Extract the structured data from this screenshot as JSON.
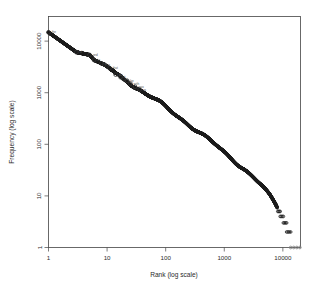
{
  "figure": {
    "title": "",
    "background": "#ffffff",
    "plot_background": "#ffffff",
    "frame_color": "#444444"
  },
  "chart_data": {
    "type": "scatter",
    "title": "",
    "subtitle": "",
    "xlabel": "Rank (log scale)",
    "ylabel": "Frequency (log scale)",
    "xscale": "log",
    "yscale": "log",
    "grid": false,
    "legend": null,
    "xlim": [
      1,
      20000
    ],
    "ylim": [
      1,
      30000
    ],
    "xticks": [
      1,
      10,
      100,
      1000,
      10000
    ],
    "xticklabels": [
      "1",
      "10",
      "100",
      "1000",
      "10000"
    ],
    "yticks": [
      1,
      10,
      100,
      1000,
      10000
    ],
    "yticklabels": [
      "1",
      "10",
      "100",
      "1000",
      "10000"
    ],
    "marker": "open-circle",
    "marker_color": "#1a1a1a",
    "tail_color": "#7a7a7a",
    "points": [
      {
        "rank": 1,
        "freq": 14800,
        "label": "the"
      },
      {
        "rank": 3,
        "freq": 6100,
        "label": "of"
      },
      {
        "rank": 5,
        "freq": 5400,
        "label": "and"
      },
      {
        "rank": 6,
        "freq": 4300,
        "label": "to"
      },
      {
        "rank": 8,
        "freq": 3700,
        "label": "a"
      },
      {
        "rank": 9,
        "freq": 3500,
        "label": "in"
      },
      {
        "rank": 11,
        "freq": 3000,
        "label": "that"
      },
      {
        "rank": 14,
        "freq": 2250,
        "label": "his"
      },
      {
        "rank": 17,
        "freq": 2000,
        "label": "it"
      },
      {
        "rank": 19,
        "freq": 1850,
        "label": "i"
      },
      {
        "rank": 22,
        "freq": 1700,
        "label": "he"
      },
      {
        "rank": 25,
        "freq": 1500,
        "label": "with"
      },
      {
        "rank": 30,
        "freq": 1300,
        "label": "was"
      },
      {
        "rank": 36,
        "freq": 1150,
        "label": "as"
      },
      {
        "rank": 45,
        "freq": 980,
        "label": ""
      },
      {
        "rank": 60,
        "freq": 800,
        "label": ""
      },
      {
        "rank": 80,
        "freq": 640,
        "label": ""
      },
      {
        "rank": 110,
        "freq": 480,
        "label": ""
      },
      {
        "rank": 150,
        "freq": 370,
        "label": ""
      },
      {
        "rank": 220,
        "freq": 270,
        "label": ""
      },
      {
        "rank": 320,
        "freq": 195,
        "label": ""
      },
      {
        "rank": 470,
        "freq": 140,
        "label": ""
      },
      {
        "rank": 700,
        "freq": 98,
        "label": ""
      },
      {
        "rank": 1000,
        "freq": 70,
        "label": ""
      },
      {
        "rank": 1500,
        "freq": 48,
        "label": ""
      },
      {
        "rank": 2200,
        "freq": 33,
        "label": ""
      },
      {
        "rank": 3200,
        "freq": 22,
        "label": ""
      },
      {
        "rank": 4500,
        "freq": 15,
        "label": ""
      },
      {
        "rank": 6000,
        "freq": 10,
        "label": ""
      },
      {
        "rank": 7500,
        "freq": 7,
        "label": ""
      },
      {
        "rank": 8800,
        "freq": 5,
        "label": ""
      },
      {
        "rank": 9800,
        "freq": 4,
        "label": ""
      },
      {
        "rank": 11000,
        "freq": 3,
        "label": ""
      },
      {
        "rank": 12500,
        "freq": 2,
        "label": ""
      },
      {
        "rank": 16000,
        "freq": 1,
        "label": ""
      }
    ],
    "tail_steps": [
      {
        "freq": 5,
        "rank_start": 8200,
        "rank_end": 9000
      },
      {
        "freq": 4,
        "rank_start": 9000,
        "rank_end": 10200
      },
      {
        "freq": 3,
        "rank_start": 10200,
        "rank_end": 11600
      },
      {
        "freq": 2,
        "rank_start": 11600,
        "rank_end": 13600
      },
      {
        "freq": 1,
        "rank_start": 13600,
        "rank_end": 19500
      }
    ]
  }
}
